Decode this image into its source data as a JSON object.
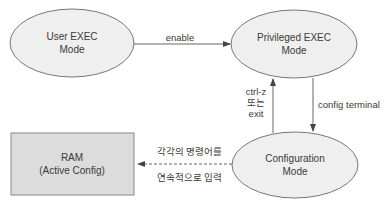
{
  "nodes": {
    "user_exec": {
      "line1": "User EXEC",
      "line2": "Mode"
    },
    "privileged_exec": {
      "line1": "Privileged EXEC",
      "line2": "Mode"
    },
    "configuration": {
      "line1": "Configuration",
      "line2": "Mode"
    },
    "ram": {
      "line1": "RAM",
      "line2": "(Active Config)"
    }
  },
  "edges": {
    "enable": {
      "label": "enable"
    },
    "exit": {
      "line1": "ctrl-z",
      "line2": "또는",
      "line3": "exit"
    },
    "config_terminal": {
      "label": "config terminal"
    },
    "to_ram": {
      "line1": "각각의 명령어를",
      "line2": "연속적으로 입력"
    }
  },
  "colors": {
    "ellipse_fill": "#eeeeee",
    "box_fill": "#dcdcdc",
    "stroke": "#777777"
  }
}
